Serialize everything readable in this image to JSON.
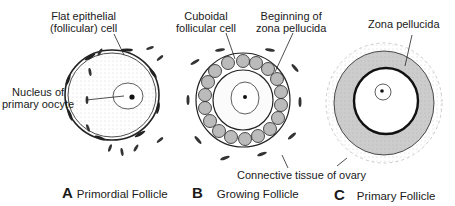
{
  "labels": {
    "flat_epithelial": "Flat epithelial\n(follicular) cell",
    "flat_epithelial_line1": "Flat epithelial",
    "flat_epithelial_line2": "(follicular) cell",
    "nucleus_line1": "Nucleus of",
    "nucleus_line2": "primary oocyte",
    "cuboidal_line1": "Cuboidal",
    "cuboidal_line2": "follicular cell",
    "beginning_line1": "Beginning of",
    "beginning_line2": "zona pellucida",
    "zona_pellucida": "Zona pellucida",
    "connective_tissue": "Connective tissue of ovary"
  },
  "panels": [
    {
      "letter": "A",
      "title": "Primordial Follicle"
    },
    {
      "letter": "B",
      "title": "Growing Follicle"
    },
    {
      "letter": "C",
      "title": "Primary Follicle"
    }
  ],
  "colors": {
    "ink": "#1a1a1a",
    "stipple": "#888888",
    "background": "#ffffff"
  }
}
